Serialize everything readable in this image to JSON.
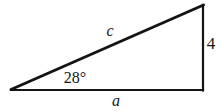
{
  "figure": {
    "type": "right-triangle-diagram",
    "background_color": "#ffffff",
    "stroke_color": "#141414",
    "labels": {
      "hypotenuse": "c",
      "base": "a",
      "opposite_side": "4",
      "angle": "28°"
    },
    "vertices": {
      "left": [
        11,
        90
      ],
      "bottom_right": [
        203,
        90
      ],
      "top_right": [
        203,
        5
      ]
    },
    "stroke_widths": {
      "hypotenuse": 3,
      "base": 2,
      "vertical": 2
    }
  }
}
